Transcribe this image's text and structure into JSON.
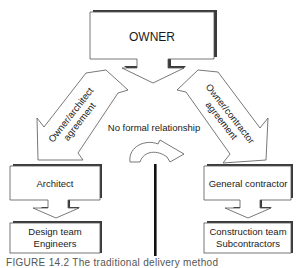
{
  "diagram": {
    "nodes": {
      "owner": "OWNER",
      "architect": "Architect",
      "design_team_line1": "Design team",
      "design_team_line2": "Engineers",
      "general_contractor": "General contractor",
      "construction_team_line1": "Construction team",
      "construction_team_line2": "Subcontractors"
    },
    "edges": {
      "owner_architect_line1": "Owner/architect",
      "owner_architect_line2": "agreement",
      "owner_contractor_line1": "Owner/contractor",
      "owner_contractor_line2": "agreement",
      "no_relationship": "No formal relationship"
    },
    "caption": "FIGURE 14.2 The traditional delivery method"
  }
}
